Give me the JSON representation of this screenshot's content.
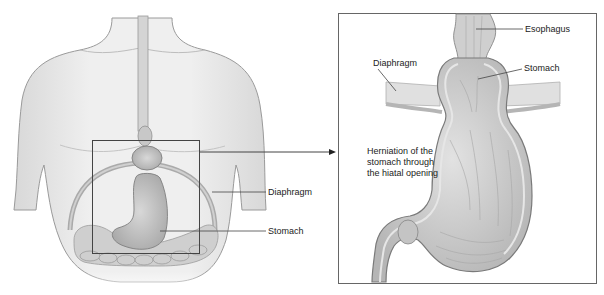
{
  "figure": {
    "left_panel": {
      "description": "Front view of human torso showing esophagus, stomach, diaphragm and intestines",
      "labels": {
        "diaphragm": "Diaphragm",
        "stomach": "Stomach"
      }
    },
    "right_panel": {
      "description": "Magnified cross-section of stomach herniating through the diaphragm",
      "labels": {
        "esophagus": "Esophagus",
        "diaphragm": "Diaphragm",
        "stomach": "Stomach",
        "herniation_line1": "Herniation of the",
        "herniation_line2": "stomach through",
        "herniation_line3": "the hiatal opening"
      }
    },
    "colors": {
      "skin": "#e9e9e9",
      "outline": "#8a8a8a",
      "organ": "#c9c9c9",
      "organ_dark": "#9a9a9a",
      "frame": "#555555",
      "text": "#222222"
    }
  }
}
